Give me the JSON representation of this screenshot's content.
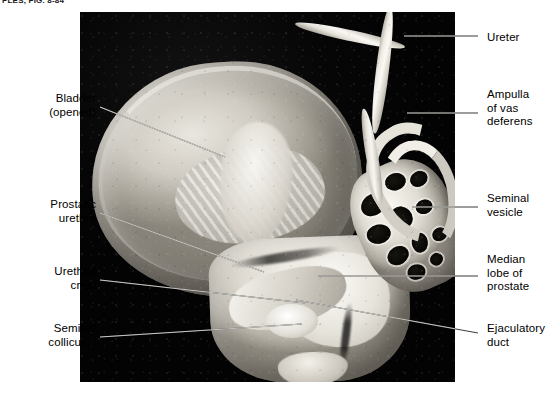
{
  "page": {
    "running_head": "PLES, FIG. 8-84",
    "figure_kind": "anatomical-photograph",
    "background_color": "#ffffff",
    "plate_color": "#050505",
    "leader_line_color": "#c9c7c2",
    "text_color": "#000000"
  },
  "labels_left": [
    {
      "id": "bladder",
      "text": "Bladder\n(opened)",
      "x": 18,
      "y": 92,
      "width": 78,
      "leader_from_x": 100,
      "leader_from_y": 107,
      "leader_to_x": 225,
      "leader_to_y": 157
    },
    {
      "id": "prostatic-urethra",
      "text": "Prostatic\nurethra",
      "x": 12,
      "y": 198,
      "width": 84,
      "leader_from_x": 100,
      "leader_from_y": 213,
      "leader_to_x": 264,
      "leader_to_y": 272
    },
    {
      "id": "urethral-crest",
      "text": "Urethral\ncrest",
      "x": 12,
      "y": 265,
      "width": 84,
      "leader_from_x": 100,
      "leader_from_y": 280,
      "leader_to_x": 305,
      "leader_to_y": 303
    },
    {
      "id": "seminal-colliculus",
      "text": "Seminal\ncolliculus",
      "x": 8,
      "y": 322,
      "width": 88,
      "leader_from_x": 100,
      "leader_from_y": 337,
      "leader_to_x": 302,
      "leader_to_y": 324
    }
  ],
  "labels_right": [
    {
      "id": "ureter",
      "text": "Ureter",
      "x": 487,
      "y": 31,
      "width": 64,
      "leader_from_x": 478,
      "leader_from_y": 36,
      "leader_to_x": 404,
      "leader_to_y": 36
    },
    {
      "id": "ampulla-vas",
      "text": "Ampulla\nof vas\ndeferens",
      "x": 487,
      "y": 88,
      "width": 66,
      "leader_from_x": 478,
      "leader_from_y": 113,
      "leader_to_x": 407,
      "leader_to_y": 113
    },
    {
      "id": "seminal-vesicle",
      "text": "Seminal\nvesicle",
      "x": 487,
      "y": 192,
      "width": 64,
      "leader_from_x": 478,
      "leader_from_y": 207,
      "leader_to_x": 412,
      "leader_to_y": 207
    },
    {
      "id": "median-lobe",
      "text": "Median\nlobe of\nprostate",
      "x": 487,
      "y": 253,
      "width": 66,
      "leader_from_x": 478,
      "leader_from_y": 276,
      "leader_to_x": 318,
      "leader_to_y": 276
    },
    {
      "id": "ejaculatory-duct",
      "text": "Ejaculatory\nduct",
      "x": 487,
      "y": 322,
      "width": 74,
      "leader_from_x": 478,
      "leader_from_y": 333,
      "leader_to_x": 296,
      "leader_to_y": 300
    }
  ],
  "structures": [
    {
      "id": "bladder-body",
      "name": "bladder-wall-opened"
    },
    {
      "id": "bladder-mucosa",
      "name": "bladder-mucosal-folds"
    },
    {
      "id": "bladder-trigone",
      "name": "bladder-trigone"
    },
    {
      "id": "prostate-block",
      "name": "prostate-gland"
    },
    {
      "id": "median-lobe",
      "name": "median-lobe-of-prostate"
    },
    {
      "id": "urethra-groove",
      "name": "prostatic-urethra-lumen"
    },
    {
      "id": "urethral-crest-ridge",
      "name": "urethral-crest"
    },
    {
      "id": "colliculus-bump",
      "name": "seminal-colliculus"
    },
    {
      "id": "ejac-duct-cleft",
      "name": "ejaculatory-duct"
    },
    {
      "id": "seminal-vesicle",
      "name": "seminal-vesicle-sectioned"
    },
    {
      "id": "ureter-tube",
      "name": "ureter"
    },
    {
      "id": "vas-ampulla",
      "name": "ampulla-of-vas-deferens"
    }
  ],
  "loculi": [
    {
      "x": 14,
      "y": 22,
      "w": 26,
      "h": 21,
      "r": -14
    },
    {
      "x": 46,
      "y": 12,
      "w": 21,
      "h": 17,
      "r": 8
    },
    {
      "x": 70,
      "y": 20,
      "w": 18,
      "h": 15,
      "r": -6
    },
    {
      "x": 8,
      "y": 52,
      "w": 24,
      "h": 19,
      "r": 12
    },
    {
      "x": 38,
      "y": 44,
      "w": 20,
      "h": 23,
      "r": -20
    },
    {
      "x": 64,
      "y": 48,
      "w": 17,
      "h": 14,
      "r": 4
    },
    {
      "x": 18,
      "y": 80,
      "w": 22,
      "h": 18,
      "r": -8
    },
    {
      "x": 46,
      "y": 76,
      "w": 16,
      "h": 20,
      "r": 16
    },
    {
      "x": 68,
      "y": 80,
      "w": 15,
      "h": 13,
      "r": -4
    },
    {
      "x": 30,
      "y": 104,
      "w": 18,
      "h": 15,
      "r": 10
    },
    {
      "x": 56,
      "y": 102,
      "w": 13,
      "h": 12,
      "r": -12
    }
  ]
}
